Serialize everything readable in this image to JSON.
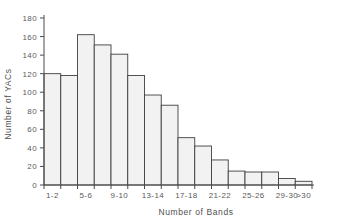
{
  "chart_data": {
    "type": "bar",
    "title": "",
    "xlabel": "Number of Bands",
    "ylabel": "Number of YACs",
    "ylim": [
      0,
      180
    ],
    "yticks": [
      0,
      20,
      40,
      60,
      80,
      100,
      120,
      140,
      160,
      180
    ],
    "ytick_labels": [
      "0",
      "20",
      "40",
      "60",
      "80",
      "100",
      "120",
      "140",
      "160",
      "180"
    ],
    "grid": false,
    "legend": false,
    "bin_count": 16,
    "categories": [
      "1-2",
      "3-4",
      "5-6",
      "7-8",
      "9-10",
      "11-12",
      "13-14",
      "15-16",
      "17-18",
      "19-20",
      "21-22",
      "23-24",
      "25-26",
      "27-28",
      "29-30",
      ">30"
    ],
    "xtick_labels": [
      "1-2",
      "5-6",
      "9-10",
      "13-14",
      "17-18",
      "21-22",
      "25-26",
      "29-30",
      ">30"
    ],
    "xtick_label_indices": [
      0,
      2,
      4,
      6,
      8,
      10,
      12,
      14,
      15
    ],
    "values": [
      120,
      118,
      162,
      151,
      141,
      118,
      97,
      86,
      51,
      42,
      27,
      15,
      14,
      14,
      7,
      4
    ],
    "bar_fill_color": "#f2f2f2",
    "bar_edge_color": "#3f3f3f",
    "axis_color": "#4a4a4a"
  }
}
